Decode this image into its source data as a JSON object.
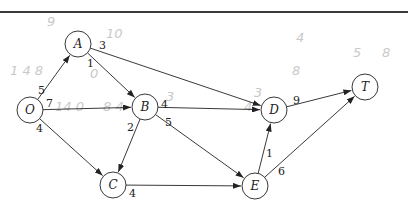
{
  "diagram": {
    "type": "directed-weighted-network",
    "node_radius": 13,
    "colors": {
      "stroke": "#222222",
      "node_fill": "#ffffff",
      "rule": "#3a3a3a",
      "pencil": "#c9c9c9"
    },
    "nodes": [
      {
        "id": "O",
        "label": "O",
        "x": 30,
        "y": 110
      },
      {
        "id": "A",
        "label": "A",
        "x": 78,
        "y": 44
      },
      {
        "id": "B",
        "label": "B",
        "x": 145,
        "y": 107
      },
      {
        "id": "C",
        "label": "C",
        "x": 113,
        "y": 185
      },
      {
        "id": "D",
        "label": "D",
        "x": 274,
        "y": 110
      },
      {
        "id": "E",
        "label": "E",
        "x": 255,
        "y": 186
      },
      {
        "id": "T",
        "label": "T",
        "x": 365,
        "y": 87
      }
    ],
    "edges": [
      {
        "from": "O",
        "to": "A",
        "weight": "5",
        "lx": 38,
        "ly": 94
      },
      {
        "from": "O",
        "to": "B",
        "weight": "7",
        "lx": 46,
        "ly": 107
      },
      {
        "from": "O",
        "to": "C",
        "weight": "4",
        "lx": 36,
        "ly": 132
      },
      {
        "from": "A",
        "to": "B",
        "weight": "1",
        "lx": 87,
        "ly": 67
      },
      {
        "from": "A",
        "to": "D",
        "weight": "3",
        "lx": 99,
        "ly": 49
      },
      {
        "from": "B",
        "to": "C",
        "weight": "2",
        "lx": 127,
        "ly": 131
      },
      {
        "from": "B",
        "to": "D",
        "weight": "4",
        "lx": 161,
        "ly": 108
      },
      {
        "from": "B",
        "to": "E",
        "weight": "5",
        "lx": 165,
        "ly": 126
      },
      {
        "from": "C",
        "to": "E",
        "weight": "4",
        "lx": 129,
        "ly": 197
      },
      {
        "from": "E",
        "to": "D",
        "weight": "1",
        "lx": 266,
        "ly": 157
      },
      {
        "from": "E",
        "to": "T",
        "weight": "6",
        "lx": 278,
        "ly": 175
      },
      {
        "from": "D",
        "to": "T",
        "weight": "9",
        "lx": 293,
        "ly": 104
      }
    ],
    "pencil_annotations": [
      {
        "text": "9",
        "x": 47,
        "y": 26
      },
      {
        "text": "10",
        "x": 106,
        "y": 38
      },
      {
        "text": "1 4 8",
        "x": 10,
        "y": 75
      },
      {
        "text": "0",
        "x": 90,
        "y": 78
      },
      {
        "text": "14 0",
        "x": 55,
        "y": 111
      },
      {
        "text": "8 4",
        "x": 103,
        "y": 111
      },
      {
        "text": "3",
        "x": 166,
        "y": 101
      },
      {
        "text": "3",
        "x": 254,
        "y": 97
      },
      {
        "text": "4",
        "x": 244,
        "y": 111
      },
      {
        "text": "4",
        "x": 296,
        "y": 42
      },
      {
        "text": "8",
        "x": 292,
        "y": 75
      },
      {
        "text": "5",
        "x": 353,
        "y": 57
      },
      {
        "text": "8",
        "x": 382,
        "y": 57
      }
    ]
  }
}
